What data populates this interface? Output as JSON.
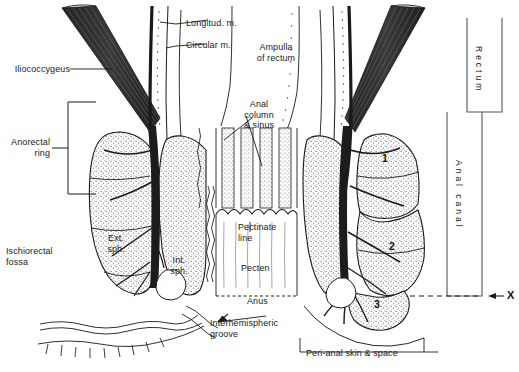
{
  "figure": {
    "bg_color": "#ffffff",
    "ink_color": "#1a1a1a",
    "muscle_color": "#2e2e2e",
    "stipple_color": "#4a4a4a"
  },
  "labels": {
    "iliococcygeus": "Iliococcygeus",
    "anorectal_ring": "Anorectal\nring",
    "ischiorectal_fossa": "Ischiorectal\nfossa",
    "ext_sph": "Ext.\nsph.",
    "int_sph": "Int.\nsph.",
    "longitudinal_m": "Longitud. m.",
    "circular_m": "Circular m.",
    "ampulla": "Ampulla\nof rectum",
    "anal_column": "Anal\ncolumn\n& sinus",
    "pectinate_line": "Pectinate\nline",
    "pecten": "Pecten",
    "anus": "Anus",
    "interhemispheric": "Interhemispheric\ngroove",
    "perianal": "Peri-anal skin & space"
  },
  "brackets": {
    "rectum": "Rectum",
    "anal_canal": "Anal canal",
    "x_marker": "X"
  },
  "sphincter_parts": [
    {
      "id": "1",
      "name": "deep-external-sphincter"
    },
    {
      "id": "2",
      "name": "superficial-external-sphincter"
    },
    {
      "id": "3",
      "name": "subcutaneous-external-sphincter"
    }
  ]
}
